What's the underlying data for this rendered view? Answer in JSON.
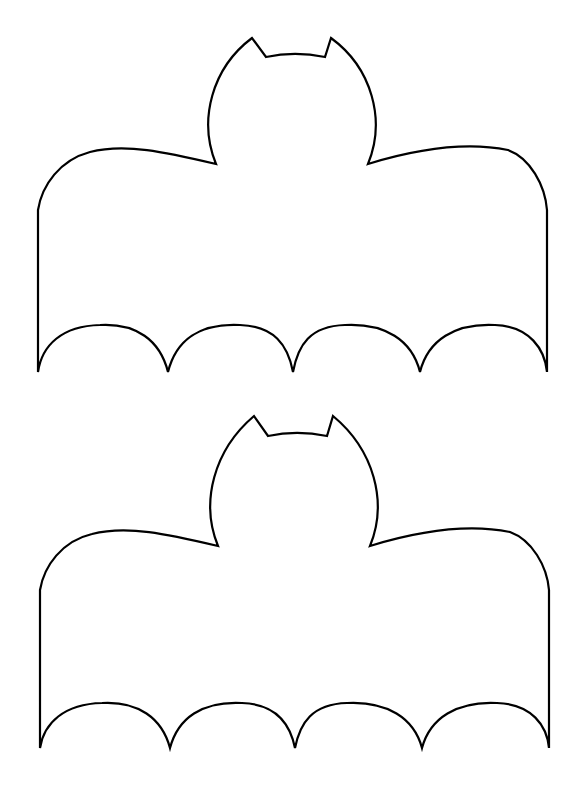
{
  "page": {
    "background": "#ffffff",
    "stroke_color": "#000000"
  },
  "bats": [
    {
      "label": "bat-outline-top",
      "offset_y": 0
    },
    {
      "label": "bat-outline-bottom",
      "offset_y": 376
    }
  ]
}
